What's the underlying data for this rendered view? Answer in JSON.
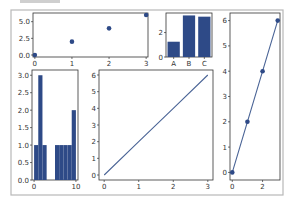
{
  "figure": {
    "width": 293,
    "height": 205,
    "frame_color": "#b8b8b8",
    "series_color": "#2e4a87",
    "line_color": "#4a6496"
  },
  "chart_data": [
    {
      "id": "top-left-scatter",
      "type": "scatter",
      "title": "",
      "x": [
        0,
        1,
        2,
        3
      ],
      "y": [
        0,
        2,
        4,
        6
      ],
      "xticks": [
        "0",
        "1",
        "2",
        "3"
      ],
      "yticks": [
        "0.0",
        "2.5",
        "5.0"
      ],
      "xlim": [
        -0.05,
        3.05
      ],
      "ylim": [
        -0.3,
        6.3
      ],
      "grid": false
    },
    {
      "id": "top-middle-bar",
      "type": "bar",
      "title": "",
      "categories": [
        "A",
        "B",
        "C"
      ],
      "values": [
        1.25,
        3.4,
        3.3
      ],
      "yticks": [
        "0",
        "2"
      ],
      "ylim": [
        0,
        3.6
      ],
      "grid": false
    },
    {
      "id": "right-line-markers",
      "type": "line",
      "title": "",
      "x": [
        0,
        1,
        2,
        3
      ],
      "y": [
        0,
        2,
        4,
        6
      ],
      "markers": true,
      "xticks": [
        "0",
        "2"
      ],
      "yticks": [
        "0",
        "1",
        "2",
        "3",
        "4",
        "5",
        "6"
      ],
      "xlim": [
        -0.15,
        3.15
      ],
      "ylim": [
        -0.3,
        6.3
      ],
      "grid": false
    },
    {
      "id": "bottom-left-histogram",
      "type": "bar",
      "subtype": "histogram",
      "title": "",
      "bin_edges": [
        0,
        1,
        2,
        3,
        4,
        5,
        6,
        7,
        8,
        9,
        10
      ],
      "values": [
        1,
        3,
        1,
        0,
        0,
        1,
        1,
        1,
        1,
        2
      ],
      "xticks": [
        "0",
        "10"
      ],
      "yticks": [
        "0.0",
        "0.5",
        "1.0",
        "1.5",
        "2.0",
        "2.5",
        "3.0"
      ],
      "ylim": [
        0,
        3.15
      ],
      "grid": false
    },
    {
      "id": "bottom-middle-line",
      "type": "line",
      "title": "",
      "x": [
        0,
        1,
        2,
        3
      ],
      "y": [
        0,
        2,
        4,
        6
      ],
      "markers": false,
      "xticks": [
        "0",
        "1",
        "2",
        "3"
      ],
      "yticks": [
        "0",
        "1",
        "2",
        "3",
        "4",
        "5",
        "6"
      ],
      "xlim": [
        -0.15,
        3.15
      ],
      "ylim": [
        -0.3,
        6.3
      ],
      "grid": false
    }
  ]
}
